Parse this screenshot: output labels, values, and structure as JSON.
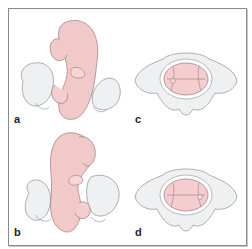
{
  "figure": {
    "panels": [
      {
        "id": "a",
        "label": "a",
        "subject": "fetus-in-pelvis-view-1"
      },
      {
        "id": "b",
        "label": "b",
        "subject": "fetus-in-pelvis-view-2"
      },
      {
        "id": "c",
        "label": "c",
        "subject": "pelvic-inlet-view-1"
      },
      {
        "id": "d",
        "label": "d",
        "subject": "pelvic-inlet-view-2"
      }
    ],
    "colors": {
      "fetus_fill": "#f2c9c9",
      "fetus_stroke": "#9a7a7a",
      "pelvis_fill": "#eef0f2",
      "pelvis_stroke": "#8a8f96",
      "head_fill": "#f3cdd0",
      "border": "#8a8a8a"
    }
  }
}
